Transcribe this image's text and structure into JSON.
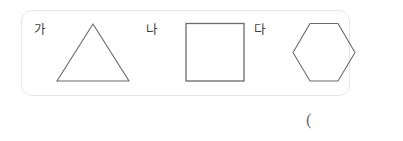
{
  "panel": {
    "border_color": "#e6e6e8",
    "background_color": "#ffffff",
    "items": [
      {
        "label": "가",
        "shape": "triangle",
        "shape_icon_name": "triangle-shape",
        "sides": 3,
        "stroke_color": "#6b6b70"
      },
      {
        "label": "나",
        "shape": "square",
        "shape_icon_name": "square-shape",
        "sides": 4,
        "stroke_color": "#6b6b70"
      },
      {
        "label": "다",
        "shape": "hexagon",
        "shape_icon_name": "hexagon-shape",
        "sides": 6,
        "stroke_color": "#6b6b70"
      }
    ]
  },
  "answer": {
    "paren": "("
  }
}
